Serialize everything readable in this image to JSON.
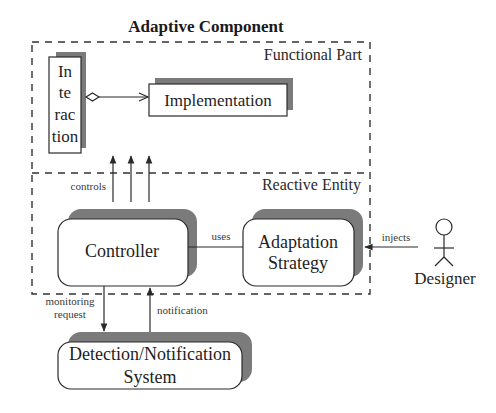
{
  "title": "Adaptive Component",
  "regions": {
    "functional": "Functional Part",
    "reactive": "Reactive Entity"
  },
  "boxes": {
    "interaction": {
      "lines": [
        "In",
        "te",
        "rac",
        "tion"
      ]
    },
    "implementation": {
      "label": "Implementation"
    },
    "controller": {
      "label": "Controller"
    },
    "adaptation_strategy": {
      "lines": [
        "Adaptation",
        "Strategy"
      ]
    },
    "detection_notification": {
      "lines": [
        "Detection/Notification",
        "System"
      ]
    }
  },
  "actor": {
    "label": "Designer"
  },
  "edges": {
    "controls": "controls",
    "uses": "uses",
    "injects": "injects",
    "monitoring_request": [
      "monitoring",
      "request"
    ],
    "notification": "notification"
  },
  "colors": {
    "shadow": "#7b7b7b",
    "stroke": "#2a2a2a",
    "background": "#ffffff"
  }
}
